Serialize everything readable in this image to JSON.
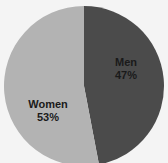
{
  "chart_data": {
    "type": "pie",
    "title": "",
    "slices": [
      {
        "label": "Men",
        "value": 47,
        "display": "47%",
        "color": "#4b4b4b"
      },
      {
        "label": "Women",
        "value": 53,
        "display": "53%",
        "color": "#b3b3b3"
      }
    ],
    "start_angle_deg": 0,
    "direction": "clockwise",
    "legend": "none"
  },
  "labels": {
    "men_name": "Men",
    "men_pct": "47%",
    "women_name": "Women",
    "women_pct": "53%"
  },
  "colors": {
    "men": "#4b4b4b",
    "women": "#b3b3b3",
    "background": "#f4f4f4"
  }
}
